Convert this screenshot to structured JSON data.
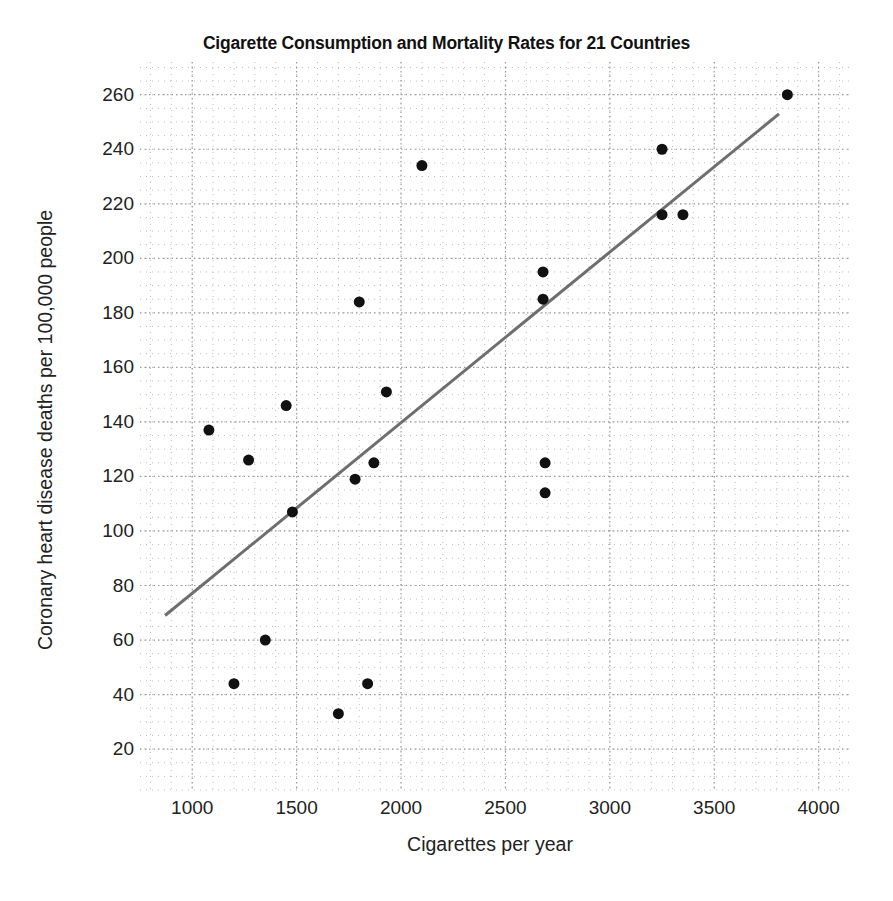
{
  "chart_data": {
    "type": "scatter",
    "title": "Cigarette Consumption and Mortality Rates for 21 Countries",
    "xlabel": "Cigarettes per year",
    "ylabel": "Coronary heart disease deaths per 100,000 people",
    "xlim": [
      750,
      4150
    ],
    "ylim": [
      5,
      272
    ],
    "xticks": [
      1000,
      1500,
      2000,
      2500,
      3000,
      3500,
      4000
    ],
    "yticks": [
      20,
      40,
      60,
      80,
      100,
      120,
      140,
      160,
      180,
      200,
      220,
      240,
      260
    ],
    "xtick_labels": [
      "1000",
      "1500",
      "2000",
      "2500",
      "3000",
      "3500",
      "4000"
    ],
    "ytick_labels": [
      "20",
      "40",
      "60",
      "80",
      "100",
      "120",
      "140",
      "160",
      "180",
      "200",
      "220",
      "240",
      "260"
    ],
    "grid": true,
    "grid_style": "dotted",
    "grid_minor": true,
    "legend": false,
    "marker": "filled-circle",
    "marker_color": "#111111",
    "marker_size": 11,
    "points": [
      {
        "x": 1080,
        "y": 137
      },
      {
        "x": 1200,
        "y": 44
      },
      {
        "x": 1270,
        "y": 126
      },
      {
        "x": 1350,
        "y": 60
      },
      {
        "x": 1450,
        "y": 146
      },
      {
        "x": 1480,
        "y": 107
      },
      {
        "x": 1700,
        "y": 33
      },
      {
        "x": 1780,
        "y": 119
      },
      {
        "x": 1800,
        "y": 184
      },
      {
        "x": 1840,
        "y": 44
      },
      {
        "x": 1870,
        "y": 125
      },
      {
        "x": 1930,
        "y": 151
      },
      {
        "x": 2100,
        "y": 234
      },
      {
        "x": 2680,
        "y": 195
      },
      {
        "x": 2680,
        "y": 185
      },
      {
        "x": 2690,
        "y": 125
      },
      {
        "x": 2690,
        "y": 114
      },
      {
        "x": 3250,
        "y": 240
      },
      {
        "x": 3250,
        "y": 216
      },
      {
        "x": 3350,
        "y": 216
      },
      {
        "x": 3850,
        "y": 260
      }
    ],
    "trendline": {
      "type": "linear-fit",
      "color": "#6e6e6e",
      "width": 3,
      "x_start": 870,
      "y_start": 69,
      "x_end": 3810,
      "y_end": 253
    },
    "n_points": 21
  }
}
